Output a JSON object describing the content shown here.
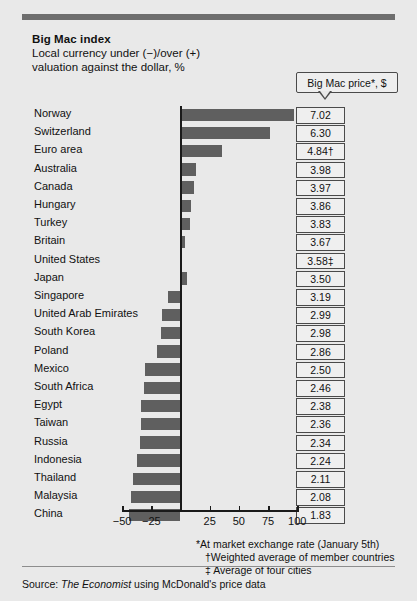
{
  "header": {
    "title": "Big Mac index",
    "subtitle_line1": "Local currency under (−)/over (+)",
    "subtitle_line2": "valuation against the dollar, %",
    "price_column_header": "Big Mac price*, $"
  },
  "footnotes": {
    "star": "*At market exchange rate (January 5th)",
    "dagger": "†Weighted average of member countries",
    "double_dagger": "‡ Average of four cities"
  },
  "source": {
    "prefix": "Source: ",
    "publication": "The Economist",
    "suffix": " using McDonald's price data"
  },
  "colors": {
    "background": "#e9e9e9",
    "bar": "#5f5f5f",
    "axis": "#1a1a1a",
    "rule": "#6e6e6e",
    "box_border": "#4a4a4a"
  },
  "chart_data": {
    "type": "bar",
    "title": "Big Mac index",
    "subtitle": "Local currency under (−)/over (+) valuation against the dollar, %",
    "xlabel": "",
    "ylabel": "",
    "orientation": "horizontal",
    "xlim": [
      -50,
      100
    ],
    "xticks": [
      -50,
      -25,
      0,
      25,
      50,
      75,
      100
    ],
    "xticklabels": [
      "−50",
      "−25",
      "",
      "25",
      "50",
      "75",
      "100"
    ],
    "grid": false,
    "zero_reference_line": 0,
    "legend": "none",
    "categories": [
      "Norway",
      "Switzerland",
      "Euro area",
      "Australia",
      "Canada",
      "Hungary",
      "Turkey",
      "Britain",
      "United States",
      "Japan",
      "Singapore",
      "United Arab Emirates",
      "South Korea",
      "Poland",
      "Mexico",
      "South Africa",
      "Egypt",
      "Taiwan",
      "Russia",
      "Indonesia",
      "Thailand",
      "Malaysia",
      "China"
    ],
    "values": [
      96,
      76,
      35,
      12,
      11,
      8,
      7,
      3,
      0,
      5,
      -11,
      -16,
      -17,
      -20,
      -30,
      -31,
      -34,
      -34,
      -35,
      -37,
      -41,
      -42,
      -44
    ],
    "price_label_header": "Big Mac price*, $",
    "price_values": [
      "7.02",
      "6.30",
      "4.84†",
      "3.98",
      "3.97",
      "3.86",
      "3.83",
      "3.67",
      "3.58‡",
      "3.50",
      "3.19",
      "2.99",
      "2.98",
      "2.86",
      "2.50",
      "2.46",
      "2.38",
      "2.36",
      "2.34",
      "2.24",
      "2.11",
      "2.08",
      "1.83"
    ]
  }
}
